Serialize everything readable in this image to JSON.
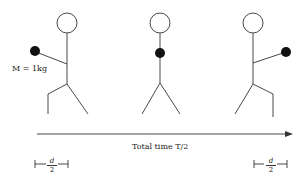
{
  "figure": {
    "mass_label": "M = 1kg",
    "time_label": "Total time T/2",
    "left_bracket": {
      "numerator": "d",
      "denominator": "2"
    },
    "right_bracket": {
      "numerator": "d",
      "denominator": "2"
    },
    "figures": [
      {
        "name": "left-figure",
        "ball_position": "arm extended left"
      },
      {
        "name": "center-figure",
        "ball_position": "at chest"
      },
      {
        "name": "right-figure",
        "ball_position": "arm extended right"
      }
    ]
  }
}
